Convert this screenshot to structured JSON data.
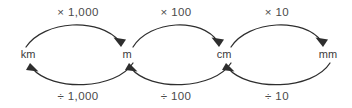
{
  "diagram": {
    "background_color": "#ffffff",
    "line_color": "#2e2e2e",
    "text_color": "#3b3b3b",
    "units": [
      {
        "label": "km",
        "x": 28,
        "y": 55
      },
      {
        "label": "m",
        "x": 127,
        "y": 55
      },
      {
        "label": "cm",
        "x": 224,
        "y": 55
      },
      {
        "label": "mm",
        "x": 328,
        "y": 55
      }
    ],
    "multiply_labels": [
      {
        "label": "× 1,000",
        "x": 78,
        "y": 13
      },
      {
        "label": "× 100",
        "x": 176,
        "y": 13
      },
      {
        "label": "× 10",
        "x": 277,
        "y": 13
      }
    ],
    "divide_labels": [
      {
        "label": "÷ 1,000",
        "x": 78,
        "y": 97
      },
      {
        "label": "÷ 100",
        "x": 176,
        "y": 97
      },
      {
        "label": "÷ 10",
        "x": 277,
        "y": 97
      }
    ],
    "multiply_arrows": [
      {
        "from": "km",
        "to": "m",
        "operation": "× 1,000",
        "direction": "left-to-right"
      },
      {
        "from": "m",
        "to": "cm",
        "operation": "× 100",
        "direction": "left-to-right"
      },
      {
        "from": "cm",
        "to": "mm",
        "operation": "× 10",
        "direction": "left-to-right"
      }
    ],
    "divide_arrows": [
      {
        "from": "m",
        "to": "km",
        "operation": "÷ 1,000",
        "direction": "right-to-left"
      },
      {
        "from": "cm",
        "to": "m",
        "operation": "÷ 100",
        "direction": "right-to-left"
      },
      {
        "from": "mm",
        "to": "cm",
        "operation": "÷ 10",
        "direction": "right-to-left"
      }
    ]
  }
}
